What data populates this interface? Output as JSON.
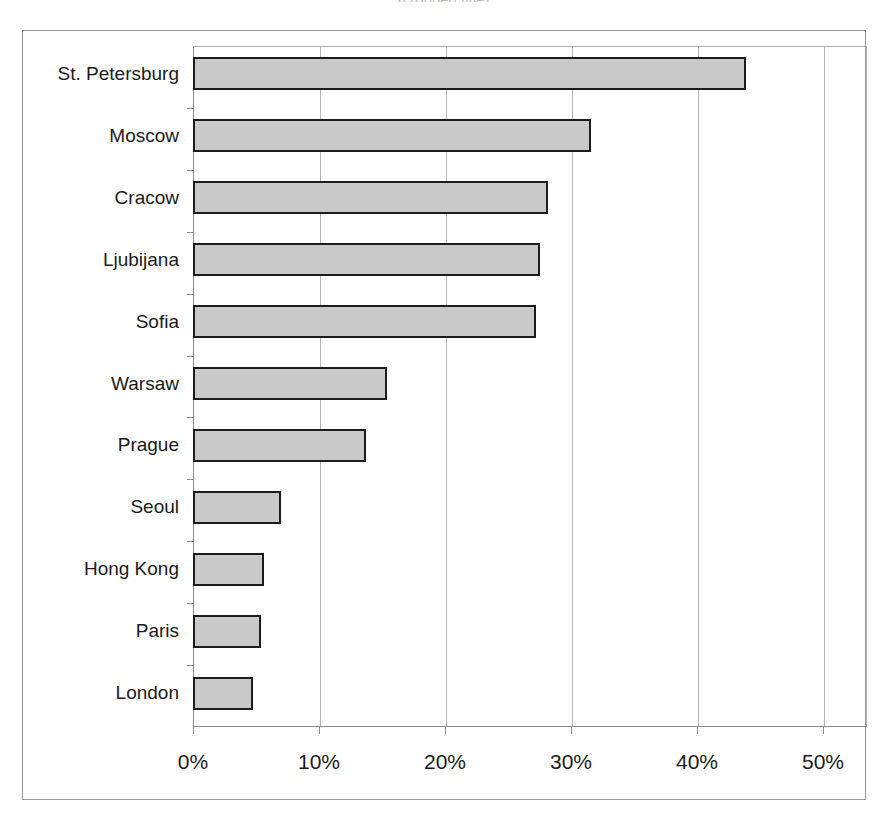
{
  "chart_data": {
    "type": "bar",
    "orientation": "horizontal",
    "title": "",
    "xlabel": "",
    "ylabel": "",
    "xlim": [
      0,
      50
    ],
    "xticks": [
      "0%",
      "10%",
      "20%",
      "30%",
      "40%",
      "50%"
    ],
    "xtick_values": [
      0,
      10,
      20,
      30,
      40,
      50
    ],
    "tick_suffix": "%",
    "grid": "vertical",
    "legend": "none",
    "categories": [
      "St. Petersburg",
      "Moscow",
      "Cracow",
      "Ljubijana",
      "Sofia",
      "Warsaw",
      "Prague",
      "Seoul",
      "Hong Kong",
      "Paris",
      "London"
    ],
    "values": [
      43.9,
      31.6,
      28.2,
      27.5,
      27.2,
      15.4,
      13.7,
      7.0,
      5.6,
      5.4,
      4.8
    ],
    "bar_fill_color": "#c9c9c9",
    "bar_border_color": "#1c1c1c",
    "plot_background": "#ffffff",
    "gridline_color": "#b5b5b5",
    "frame_color": "#9a9a9a"
  },
  "title_remnant": "(cropped title)"
}
